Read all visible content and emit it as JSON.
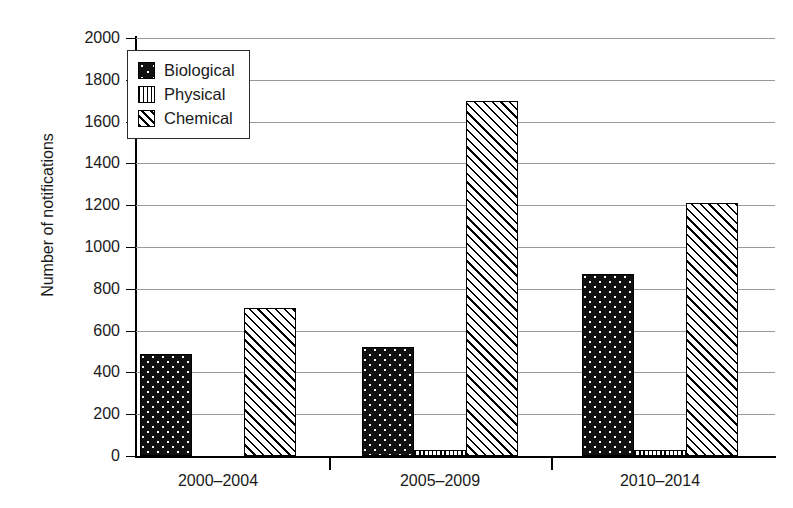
{
  "chart_data": {
    "type": "bar",
    "title": "",
    "xlabel": "",
    "ylabel": "Number of notifications",
    "categories": [
      "2000–2004",
      "2005–2009",
      "2010–2014"
    ],
    "series": [
      {
        "name": "Biological",
        "pattern": "dotted-black",
        "values": [
          490,
          520,
          870
        ]
      },
      {
        "name": "Physical",
        "pattern": "vertical-stripes",
        "values": [
          0,
          25,
          30
        ]
      },
      {
        "name": "Chemical",
        "pattern": "diagonal-hatch",
        "values": [
          710,
          1700,
          1210
        ]
      }
    ],
    "ylim": [
      0,
      2000
    ],
    "ytick_values": [
      0,
      200,
      400,
      600,
      800,
      1000,
      1200,
      1400,
      1600,
      1800,
      2000
    ],
    "ytick_labels": [
      "0",
      "200",
      "400",
      "600",
      "800",
      "1000",
      "1200",
      "1400",
      "1600",
      "1800",
      "2000"
    ],
    "grid": true,
    "grid_axis": "y",
    "legend_position": "upper-left",
    "colors": {
      "foreground": "#000000",
      "background": "#ffffff",
      "gridline": "#9a9a9a",
      "text": "#1a1a1a"
    }
  },
  "legend": {
    "entries": [
      {
        "label": "Biological"
      },
      {
        "label": "Physical"
      },
      {
        "label": "Chemical"
      }
    ]
  },
  "axes": {
    "y_title": "Number of notifications"
  }
}
